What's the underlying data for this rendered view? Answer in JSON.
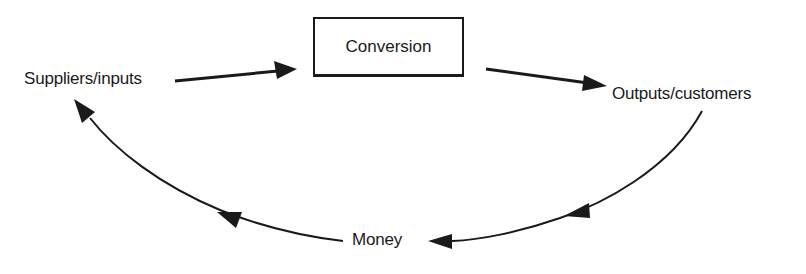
{
  "diagram": {
    "type": "cycle-flow",
    "nodes": {
      "conversion": {
        "label": "Conversion",
        "shape": "rectangle"
      },
      "suppliers": {
        "label": "Suppliers/inputs"
      },
      "outputs": {
        "label": "Outputs/customers"
      },
      "money": {
        "label": "Money"
      }
    },
    "edges": [
      {
        "from": "Suppliers/inputs",
        "to": "Conversion",
        "style": "straight-arrow"
      },
      {
        "from": "Conversion",
        "to": "Outputs/customers",
        "style": "straight-arrow"
      },
      {
        "from": "Outputs/customers",
        "to": "Money",
        "style": "curved-arrow"
      },
      {
        "from": "Money",
        "to": "Suppliers/inputs",
        "style": "curved-arrow"
      }
    ],
    "colors": {
      "ink": "#1a1a1a",
      "background": "#ffffff"
    }
  }
}
